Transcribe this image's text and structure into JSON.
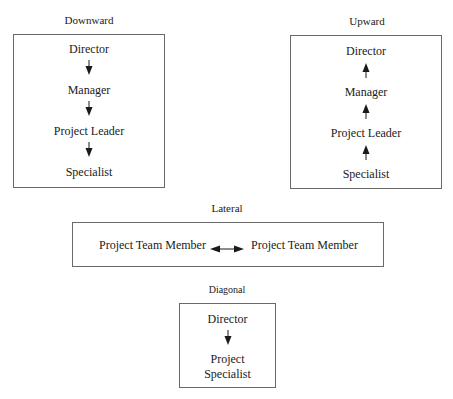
{
  "diagram": {
    "panels": [
      {
        "id": "downward",
        "title": "Downward",
        "direction": "down",
        "nodes": [
          "Director",
          "Manager",
          "Project Leader",
          "Specialist"
        ]
      },
      {
        "id": "upward",
        "title": "Upward",
        "direction": "up",
        "nodes": [
          "Director",
          "Manager",
          "Project Leader",
          "Specialist"
        ]
      },
      {
        "id": "lateral",
        "title": "Lateral",
        "direction": "both",
        "nodes": [
          "Project Team Member",
          "Project Team Member"
        ]
      },
      {
        "id": "diagonal",
        "title": "Diagonal",
        "direction": "down",
        "nodes": [
          "Director",
          "Project",
          "Specialist"
        ]
      }
    ],
    "colors": {
      "border": "#6a6a6a",
      "text": "#1a1a1a",
      "arrow": "#1a1a1a",
      "background": "#ffffff"
    }
  }
}
